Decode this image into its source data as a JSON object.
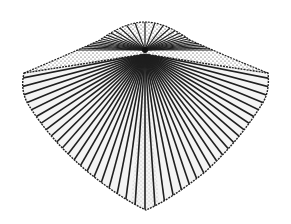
{
  "figure": {
    "style": "stippled pen-and-ink engraving",
    "background": "#ffffff",
    "ink": "#1a1a1a",
    "rib_count": 46
  }
}
